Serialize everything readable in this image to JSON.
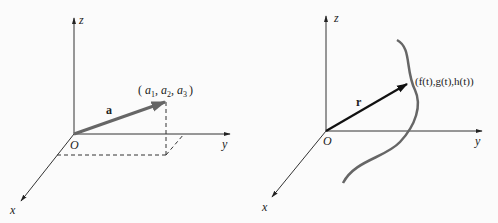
{
  "left_figure": {
    "axes": {
      "x": "x",
      "y": "y",
      "z": "z",
      "origin": "O"
    },
    "vector_label": "a",
    "point_label": "(a₁, a₂, a₃)",
    "point_parts": {
      "open": "(",
      "a1": "a",
      "s1": "1",
      "a2": "a",
      "s2": "2",
      "a3": "a",
      "s3": "3",
      "close": ")"
    }
  },
  "right_figure": {
    "axes": {
      "x": "x",
      "y": "y",
      "z": "z",
      "origin": "O"
    },
    "vector_label": "r",
    "point_label": "(f(t),g(t),h(t))"
  },
  "colors": {
    "axis": "#333333",
    "vector_a": "#666666",
    "vector_r": "#111111",
    "curve": "#666666",
    "dashed": "#333333"
  }
}
